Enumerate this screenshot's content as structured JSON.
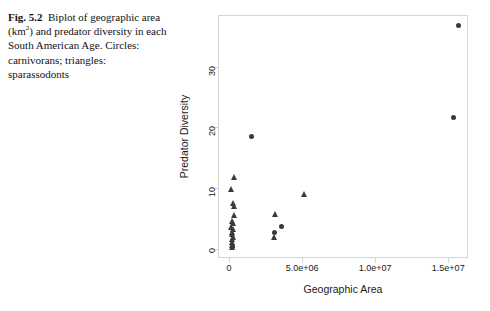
{
  "caption": {
    "figure_number": "Fig. 5.2",
    "line1_a": "Biplot of",
    "line2_a": "geographic area (km",
    "line2_sup": "2",
    "line2_b": ") and",
    "line3": "predator diversity in each",
    "line4": "South American Age. Circles:",
    "line5": "carnivorans; triangles:",
    "line6": "sparassodonts"
  },
  "colors": {
    "marker": "#3a3a3a",
    "frame": "#d6d6d6",
    "text": "#1a1a1a"
  },
  "chart_data": {
    "type": "scatter",
    "title": "",
    "xlabel": "Geographic Area",
    "ylabel": "Predator Diversity",
    "xlim": [
      -750000,
      16350000
    ],
    "ylim": [
      -1.5,
      38.5
    ],
    "grid": false,
    "legend_position": "none",
    "xticks": [
      0,
      5000000,
      10000000,
      15000000
    ],
    "xticklabels": [
      "0",
      "5.0e+06",
      "1.0e+07",
      "1.5e+07"
    ],
    "yticks": [
      0,
      10,
      20,
      30
    ],
    "yticklabels": [
      "0",
      "10",
      "20",
      "30"
    ],
    "series": [
      {
        "name": "carnivorans",
        "marker": "circle",
        "points": [
          [
            15600000,
            37.0
          ],
          [
            15300000,
            21.8
          ],
          [
            1500000,
            18.7
          ],
          [
            3500000,
            3.9
          ],
          [
            3050000,
            2.9
          ],
          [
            150000,
            0.6
          ]
        ]
      },
      {
        "name": "sparassodonts",
        "marker": "triangle",
        "points": [
          [
            330000,
            11.8
          ],
          [
            130000,
            9.8
          ],
          [
            250000,
            7.6
          ],
          [
            300000,
            7.0
          ],
          [
            350000,
            5.5
          ],
          [
            180000,
            4.6
          ],
          [
            230000,
            4.3
          ],
          [
            120000,
            3.6
          ],
          [
            280000,
            3.2
          ],
          [
            200000,
            2.8
          ],
          [
            150000,
            2.4
          ],
          [
            260000,
            2.0
          ],
          [
            180000,
            1.6
          ],
          [
            210000,
            1.1
          ],
          [
            160000,
            0.7
          ],
          [
            190000,
            0.3
          ],
          [
            3050000,
            1.9
          ],
          [
            3150000,
            5.8
          ],
          [
            5100000,
            9.1
          ]
        ]
      }
    ]
  }
}
